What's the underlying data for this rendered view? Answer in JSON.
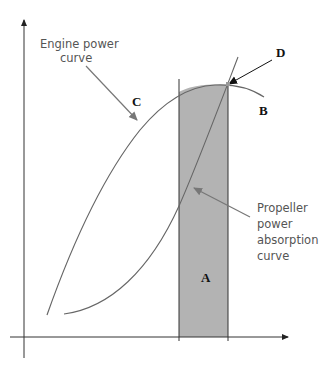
{
  "diagram": {
    "annotations": {
      "engine_curve_label": [
        "Engine power",
        "curve"
      ],
      "propeller_curve_label": [
        "Propeller",
        "power",
        "absorption",
        "curve"
      ],
      "label_A": "A",
      "label_B": "B",
      "label_C": "C",
      "label_D": "D"
    },
    "colors": {
      "axis": "#333333",
      "curve": "#666666",
      "band_fill": "#b3b3b3",
      "band_edge": "#333333",
      "leader_arrow": "#777777",
      "d_arrow": "#111111"
    },
    "elements": {
      "x_axis": "horizontal axis with arrow",
      "y_axis": "vertical axis with arrow",
      "shaded_band": "operating range region A",
      "engine_curve": "engine power curve (C to B)",
      "propeller_curve": "propeller power absorption curve",
      "intersection_point": "D - matching point"
    }
  }
}
